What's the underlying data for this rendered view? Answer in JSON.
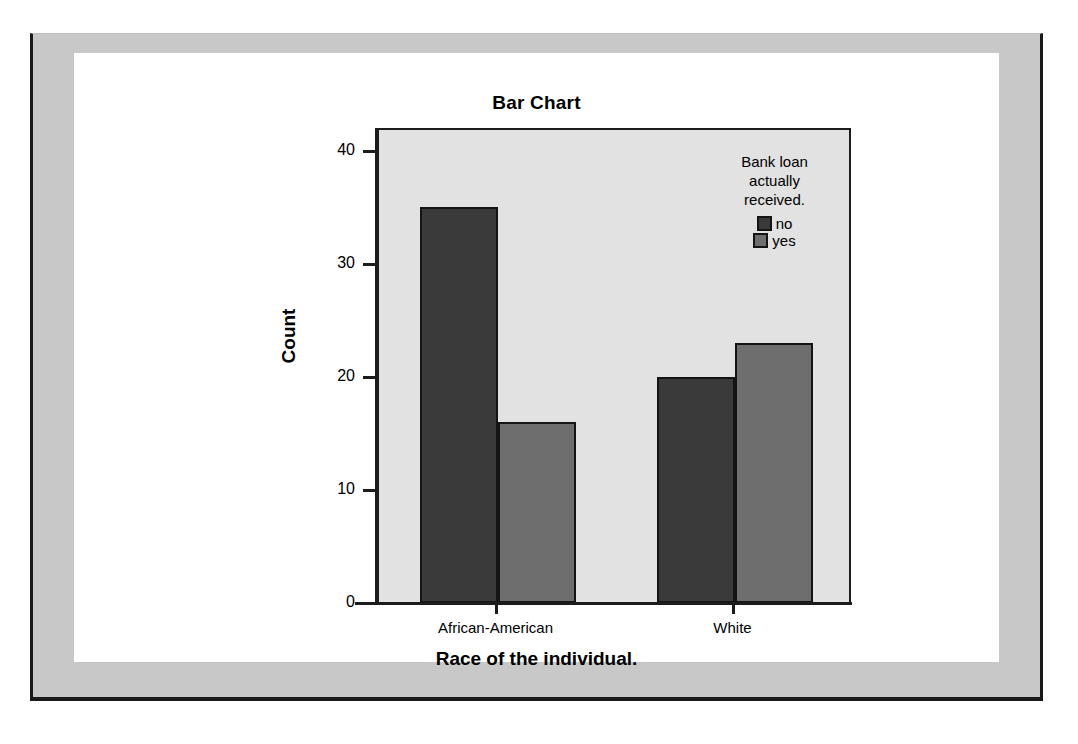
{
  "chart_data": {
    "type": "bar",
    "title": "Bar Chart",
    "xlabel": "Race of the individual.",
    "ylabel": "Count",
    "categories": [
      "African-American",
      "White"
    ],
    "series": [
      {
        "name": "no",
        "values": [
          35,
          20
        ],
        "color": "#3a3a3a"
      },
      {
        "name": "yes",
        "values": [
          16,
          23
        ],
        "color": "#6e6e6e"
      }
    ],
    "legend_title": "Bank loan actually received.",
    "legend_position": "inside-top-right",
    "ylim": [
      0,
      42
    ],
    "yticks": [
      0,
      10,
      20,
      30,
      40
    ],
    "ytick_labels": [
      "0",
      "10",
      "20",
      "30",
      "40"
    ],
    "grid": false,
    "plot_background": "#e2e2e2",
    "frame_background": "#c8c8c8",
    "canvas_background": "#ffffff",
    "bar_border_color": "#141414"
  },
  "legend": {
    "title_lines": [
      "Bank loan",
      "actually",
      "received."
    ]
  }
}
